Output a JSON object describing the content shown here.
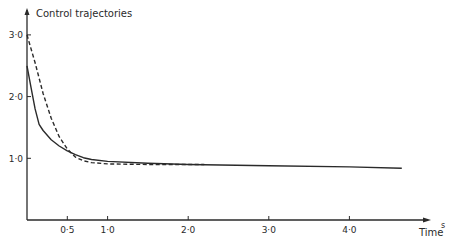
{
  "title": "Control trajectories",
  "xlabel": "Time",
  "xunit": "s",
  "colors": {
    "ink": "#2a2a2a",
    "background": "#ffffff"
  },
  "chart_data": {
    "type": "line",
    "title": "Control trajectories",
    "xlabel": "Time",
    "xunit": "s",
    "ylabel": "",
    "xlim": [
      0,
      5.0
    ],
    "ylim": [
      0,
      3.4
    ],
    "grid": false,
    "legend": null,
    "x_ticks": [
      0.5,
      1.0,
      2.0,
      3.0,
      4.0
    ],
    "x_tick_labels": [
      "0·5",
      "1·0",
      "2·0",
      "3·0",
      "4·0"
    ],
    "y_ticks": [
      1.0,
      2.0,
      3.0
    ],
    "y_tick_labels": [
      "1·0",
      "2·0",
      "3·0"
    ],
    "series": [
      {
        "name": "solid",
        "style": "solid",
        "x": [
          0.0,
          0.05,
          0.1,
          0.15,
          0.2,
          0.3,
          0.4,
          0.5,
          0.6,
          0.7,
          0.8,
          1.0,
          1.5,
          2.0,
          3.0,
          4.0,
          4.65
        ],
        "y": [
          2.5,
          2.15,
          1.8,
          1.55,
          1.45,
          1.3,
          1.2,
          1.12,
          1.06,
          1.01,
          0.98,
          0.95,
          0.92,
          0.9,
          0.88,
          0.86,
          0.84
        ]
      },
      {
        "name": "dashed",
        "style": "dashed",
        "x": [
          0.0,
          0.1,
          0.2,
          0.3,
          0.4,
          0.5,
          0.6,
          0.7,
          0.8,
          1.0,
          1.5,
          2.2
        ],
        "y": [
          3.0,
          2.55,
          2.05,
          1.65,
          1.35,
          1.15,
          1.02,
          0.96,
          0.93,
          0.91,
          0.9,
          0.9
        ]
      }
    ]
  }
}
